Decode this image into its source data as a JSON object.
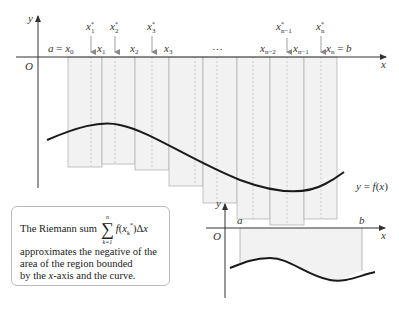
{
  "main_figure": {
    "y_axis_label": "y",
    "x_axis_label": "x",
    "origin_label": "O",
    "partition_labels": [
      "a = x0",
      "x1",
      "x2",
      "x3",
      "…",
      "xn−2",
      "xn−1",
      "xn = b"
    ],
    "sample_point_labels": [
      "x1*",
      "x2*",
      "x3*",
      "xn−1*",
      "xn*"
    ],
    "curve_label": "y = f(x)"
  },
  "note": {
    "line1_prefix": "The Riemann sum",
    "sum_upper": "n",
    "sum_lower": "k=1",
    "sum_term": "f(xk*)Δx",
    "line2": "approximates the negative of the",
    "line3": "area of the region bounded",
    "line4_prefix": "by the ",
    "line4_var": "x",
    "line4_suffix": "-axis and the curve."
  },
  "inset_figure": {
    "y_axis_label": "y",
    "x_axis_label": "x",
    "origin_label": "O",
    "a_label": "a",
    "b_label": "b"
  },
  "colors": {
    "rect_fill": "#f2f2f2",
    "rect_stroke": "#b0b0b0",
    "curve": "#1a1a1a",
    "axis": "#333333"
  }
}
